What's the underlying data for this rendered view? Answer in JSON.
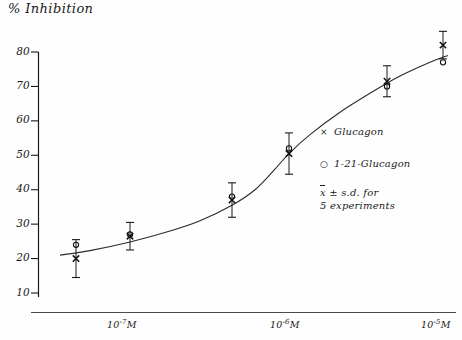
{
  "chart_data": {
    "type": "line",
    "title": "% Inhibition",
    "xlabel": "",
    "ylabel": "% Inhibition",
    "ylim": [
      10,
      80
    ],
    "yticks": [
      10,
      20,
      30,
      40,
      50,
      60,
      70,
      80
    ],
    "ytick_labels": [
      "10",
      "20",
      "30",
      "40",
      "50",
      "60",
      "70",
      "80"
    ],
    "xticks": [
      "10-7M",
      "10-6M",
      "10-5M"
    ],
    "xtick_labels": [
      {
        "mantissa": "10",
        "exponent": "-7",
        "unit": "M"
      },
      {
        "mantissa": "10",
        "exponent": "-6",
        "unit": "M"
      },
      {
        "mantissa": "10",
        "exponent": "-5",
        "unit": "M"
      }
    ],
    "grid": false,
    "legend_position": "center-right",
    "series": [
      {
        "name": "Glucagon",
        "symbol": "x",
        "x": [
          76,
          130,
          232,
          289,
          387,
          443
        ],
        "values": [
          20,
          26.5,
          37,
          50.5,
          71.5,
          82
        ],
        "errors": [
          5.5,
          4,
          5,
          6,
          4.5,
          4
        ]
      },
      {
        "name": "1-21-Glucagon",
        "symbol": "o",
        "x": [
          76,
          130,
          232,
          289,
          387,
          443
        ],
        "values": [
          24,
          27,
          38,
          52,
          70,
          77
        ],
        "errors": [
          0,
          0,
          0,
          0,
          0,
          0
        ]
      }
    ],
    "curve": [
      [
        60,
        21
      ],
      [
        90,
        22.3
      ],
      [
        130,
        24.8
      ],
      [
        170,
        28
      ],
      [
        200,
        31
      ],
      [
        232,
        35.5
      ],
      [
        255,
        40
      ],
      [
        275,
        46
      ],
      [
        289,
        50.5
      ],
      [
        310,
        56
      ],
      [
        340,
        62.5
      ],
      [
        370,
        68
      ],
      [
        400,
        73
      ],
      [
        430,
        77
      ],
      [
        448,
        79
      ]
    ],
    "annotations": [
      "x Glucagon",
      "o 1-21-Glucagon",
      "x̄ ± s.d. for 5 experiments"
    ]
  },
  "legend": {
    "entries": [
      {
        "symbol": "×",
        "label": "Glucagon"
      },
      {
        "symbol": "○",
        "label": "1-21-Glucagon"
      }
    ],
    "note_line1_prefix": "x",
    "note_line1_suffix": "± s.d. for",
    "note_line2": "5 experiments"
  },
  "axes": {
    "y_title": "% Inhibition",
    "y_tick_labels": [
      "80",
      "70",
      "60",
      "50",
      "40",
      "30",
      "20",
      "10"
    ],
    "x_tick_labels": [
      "10",
      "10",
      "10"
    ],
    "x_tick_exponents": [
      "-7",
      "-6",
      "-5"
    ],
    "x_tick_units": [
      "M",
      "M",
      "M"
    ]
  }
}
